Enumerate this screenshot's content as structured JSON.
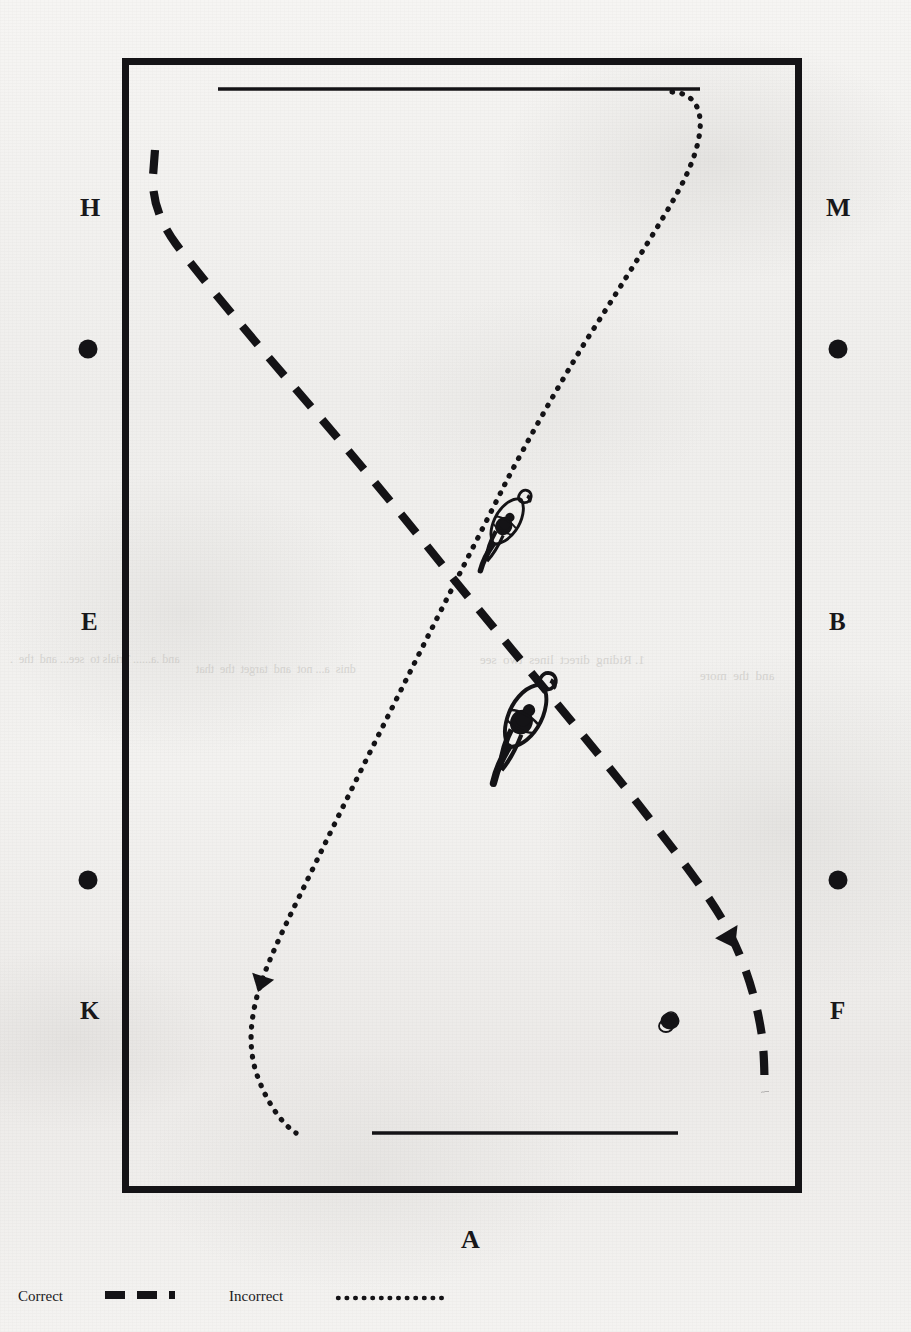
{
  "figure": {
    "kind": "dressage-arena-diagram",
    "ink_color": "#141316",
    "paper_color": "#f1f0ee",
    "arena": {
      "x": 122,
      "y": 58,
      "width": 680,
      "height": 1135,
      "border_color": "#141316",
      "border_width": 7
    },
    "poles": [
      {
        "name": "top-pole",
        "x1": 218,
        "y1": 89,
        "x2": 700,
        "y2": 89
      },
      {
        "name": "bottom-pole",
        "x1": 372,
        "y1": 1133,
        "x2": 678,
        "y2": 1133
      }
    ]
  },
  "arena_markers": [
    {
      "letter": "H",
      "side": "left",
      "x": 88,
      "y": 207
    },
    {
      "letter": "M",
      "side": "right",
      "x": 838,
      "y": 207
    },
    {
      "letter": "E",
      "side": "left",
      "x": 88,
      "y": 622
    },
    {
      "letter": "B",
      "side": "right",
      "x": 838,
      "y": 622
    },
    {
      "letter": "K",
      "side": "left",
      "x": 88,
      "y": 1011
    },
    {
      "letter": "F",
      "side": "right",
      "x": 838,
      "y": 1011
    },
    {
      "letter": "A",
      "side": "bottom",
      "x": 470,
      "y": 1241
    }
  ],
  "marker_dots": [
    {
      "name": "dot-H",
      "x": 88,
      "y": 349,
      "r": 9
    },
    {
      "name": "dot-M",
      "x": 838,
      "y": 349,
      "r": 9
    },
    {
      "name": "dot-K",
      "x": 88,
      "y": 880,
      "r": 9
    },
    {
      "name": "dot-F",
      "x": 838,
      "y": 880,
      "r": 9
    }
  ],
  "paths": [
    {
      "name": "correct-path",
      "style": "dashed",
      "label": "Correct",
      "description": "Dashed diagonal from upper-left (near H) to lower-right (near F)",
      "points": [
        [
          155,
          150
        ],
        [
          152,
          178
        ],
        [
          157,
          205
        ],
        [
          170,
          232
        ],
        [
          195,
          262
        ],
        [
          232,
          306
        ],
        [
          300,
          390
        ],
        [
          380,
          487
        ],
        [
          450,
          572
        ],
        [
          520,
          655
        ],
        [
          575,
          722
        ],
        [
          640,
          806
        ],
        [
          700,
          884
        ],
        [
          722,
          920
        ],
        [
          742,
          962
        ],
        [
          756,
          1010
        ],
        [
          764,
          1052
        ],
        [
          762,
          1080
        ],
        [
          765,
          1092
        ]
      ]
    },
    {
      "name": "incorrect-path",
      "style": "dotted",
      "label": "Incorrect",
      "description": "Dotted diagonal from top (near top pole right end) curving down-left to lower-left (near K)",
      "points": [
        [
          672,
          92
        ],
        [
          690,
          96
        ],
        [
          700,
          108
        ],
        [
          700,
          128
        ],
        [
          692,
          150
        ],
        [
          678,
          176
        ],
        [
          660,
          208
        ],
        [
          636,
          250
        ],
        [
          610,
          296
        ],
        [
          580,
          348
        ],
        [
          552,
          400
        ],
        [
          524,
          452
        ],
        [
          502,
          498
        ],
        [
          470,
          560
        ],
        [
          440,
          620
        ],
        [
          408,
          684
        ],
        [
          372,
          756
        ],
        [
          340,
          822
        ],
        [
          310,
          884
        ],
        [
          282,
          940
        ],
        [
          266,
          978
        ],
        [
          258,
          1002
        ],
        [
          250,
          1028
        ],
        [
          252,
          1058
        ],
        [
          262,
          1090
        ],
        [
          278,
          1118
        ],
        [
          294,
          1132
        ]
      ]
    }
  ],
  "arrowheads": [
    {
      "name": "arrowhead-incorrect",
      "on_path": "incorrect-path",
      "x": 258,
      "y": 990,
      "angle": 108
    },
    {
      "name": "arrowhead-correct",
      "on_path": "correct-path",
      "x": 733,
      "y": 946,
      "angle": 62
    }
  ],
  "horse_figures": [
    {
      "name": "horse-rider-incorrect",
      "on_path": "incorrect-path",
      "x": 506,
      "y": 520,
      "angle": 30,
      "scale": 1.0
    },
    {
      "name": "horse-rider-correct",
      "on_path": "correct-path",
      "x": 525,
      "y": 715,
      "angle": 28,
      "scale": 1.3
    }
  ],
  "ink_blobs": [
    {
      "name": "ink-blob-bottom-right",
      "x": 670,
      "y": 1020,
      "rx": 10,
      "ry": 9
    }
  ],
  "legend": {
    "correct": {
      "label": "Correct",
      "style": "dashed",
      "x": 18,
      "y": 1297
    },
    "incorrect": {
      "label": "Incorrect",
      "style": "dotted",
      "x": 228,
      "y": 1297
    }
  },
  "bleedthrough": [
    {
      "text": "and .a...... Trials to  see... and  the  .",
      "x": 10,
      "y": 660,
      "size": 12
    },
    {
      "text": "dnis  a... not  and  target  the  that",
      "x": 196,
      "y": 670,
      "size": 12
    },
    {
      "text": "1. Riding  direct  lines  two  see",
      "x": 480,
      "y": 660,
      "size": 13
    },
    {
      "text": "and  the  more",
      "x": 700,
      "y": 676,
      "size": 13
    }
  ]
}
